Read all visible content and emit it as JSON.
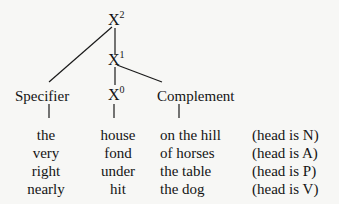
{
  "tree": {
    "nodes": {
      "x2": {
        "base": "X",
        "level": "2"
      },
      "x1": {
        "base": "X",
        "level": "1"
      },
      "x0": {
        "base": "X",
        "level": "0"
      }
    },
    "labels": {
      "specifier": "Specifier",
      "complement": "Complement"
    }
  },
  "examples": {
    "rows": [
      {
        "specifier": "the",
        "head": "house",
        "complement": "on the hill",
        "note": "(head is N)"
      },
      {
        "specifier": "very",
        "head": "fond",
        "complement": "of horses",
        "note": "(head is A)"
      },
      {
        "specifier": "right",
        "head": "under",
        "complement": "the table",
        "note": "(head is P)"
      },
      {
        "specifier": "nearly",
        "head": "hit",
        "complement": "the dog",
        "note": "(head is V)"
      }
    ]
  },
  "colors": {
    "ink": "#141414",
    "background": "#f7f7f5"
  }
}
